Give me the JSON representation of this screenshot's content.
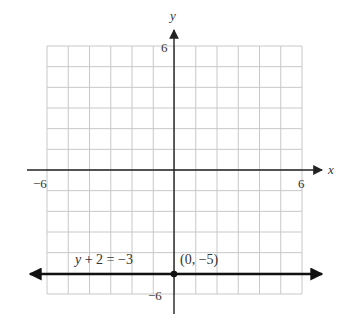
{
  "chart_data": {
    "type": "line",
    "title": "",
    "xlabel": "x",
    "ylabel": "y",
    "xlim": [
      -6,
      6
    ],
    "ylim": [
      -6,
      6
    ],
    "grid": true,
    "grid_step": 1,
    "x_tick_labels": [
      "-6",
      "6"
    ],
    "y_tick_labels": [
      "6",
      "-6"
    ],
    "series": [
      {
        "name": "y + 2 = -3",
        "equation": "y + 2 = -3",
        "kind": "horizontal line",
        "y": -5,
        "x": [
          -6,
          6
        ],
        "values": [
          -5,
          -5
        ],
        "arrows": "both ends"
      }
    ],
    "points": [
      {
        "x": 0,
        "y": -5,
        "label": "(0, −5)"
      }
    ],
    "annotations": [
      "y + 2 = −3",
      "(0, −5)"
    ]
  },
  "labels": {
    "x_axis": "x",
    "y_axis": "y",
    "x_min": "−6",
    "x_max": "6",
    "y_max": "6",
    "y_min": "−6",
    "equation": "y + 2 = −3",
    "point": "(0, −5)"
  },
  "colors": {
    "grid": "#c8c8c8",
    "axis": "#222222",
    "line": "#111111",
    "text": "#333333"
  }
}
